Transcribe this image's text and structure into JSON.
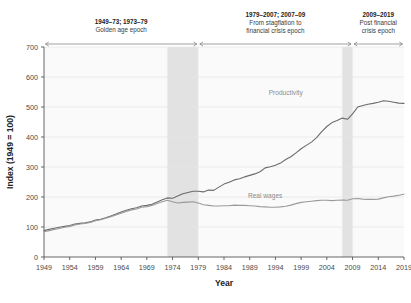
{
  "chart_data": {
    "type": "line",
    "title": "",
    "xlabel": "Year",
    "ylabel": "Index (1949 = 100)",
    "xlim": [
      1949,
      2019
    ],
    "ylim": [
      0,
      700
    ],
    "ytick_step": 100,
    "xtick_step": 5,
    "grid": true,
    "legend_position": "inline-annotations",
    "yticks": [
      "0",
      "100",
      "200",
      "300",
      "400",
      "500",
      "600",
      "700"
    ],
    "xticks": [
      "1949",
      "1954",
      "1959",
      "1964",
      "1969",
      "1974",
      "1979",
      "1984",
      "1989",
      "1994",
      "1999",
      "2004",
      "2009",
      "2014",
      "2019"
    ],
    "series": [
      {
        "name": "Productivity",
        "color": "#6b6b6b",
        "label_x": 1996,
        "label_y": 540,
        "x": [
          1949,
          1950,
          1951,
          1952,
          1953,
          1954,
          1955,
          1956,
          1957,
          1958,
          1959,
          1960,
          1961,
          1962,
          1963,
          1964,
          1965,
          1966,
          1967,
          1968,
          1969,
          1970,
          1971,
          1972,
          1973,
          1974,
          1975,
          1976,
          1977,
          1978,
          1979,
          1980,
          1981,
          1982,
          1983,
          1984,
          1985,
          1986,
          1987,
          1988,
          1989,
          1990,
          1991,
          1992,
          1993,
          1994,
          1995,
          1996,
          1997,
          1998,
          1999,
          2000,
          2001,
          2002,
          2003,
          2004,
          2005,
          2006,
          2007,
          2008,
          2009,
          2010,
          2011,
          2012,
          2013,
          2014,
          2015,
          2016,
          2017,
          2018,
          2019
        ],
        "values": [
          88,
          92,
          96,
          99,
          102,
          105,
          110,
          112,
          114,
          117,
          123,
          126,
          131,
          137,
          143,
          150,
          156,
          161,
          164,
          170,
          172,
          176,
          183,
          191,
          197,
          196,
          203,
          211,
          215,
          219,
          219,
          217,
          223,
          222,
          233,
          243,
          249,
          257,
          261,
          267,
          272,
          277,
          284,
          297,
          301,
          306,
          313,
          325,
          334,
          347,
          361,
          372,
          383,
          398,
          418,
          435,
          448,
          455,
          463,
          459,
          477,
          500,
          505,
          509,
          512,
          516,
          521,
          519,
          516,
          513,
          512
        ]
      },
      {
        "name": "Real wages",
        "color": "#9a9a9a",
        "label_x": 1992,
        "label_y": 198,
        "x": [
          1949,
          1950,
          1951,
          1952,
          1953,
          1954,
          1955,
          1956,
          1957,
          1958,
          1959,
          1960,
          1961,
          1962,
          1963,
          1964,
          1965,
          1966,
          1967,
          1968,
          1969,
          1970,
          1971,
          1972,
          1973,
          1974,
          1975,
          1976,
          1977,
          1978,
          1979,
          1980,
          1981,
          1982,
          1983,
          1984,
          1985,
          1986,
          1987,
          1988,
          1989,
          1990,
          1991,
          1992,
          1993,
          1994,
          1995,
          1996,
          1997,
          1998,
          1999,
          2000,
          2001,
          2002,
          2003,
          2004,
          2005,
          2006,
          2007,
          2008,
          2009,
          2010,
          2011,
          2012,
          2013,
          2014,
          2015,
          2016,
          2017,
          2018,
          2019
        ],
        "values": [
          84,
          88,
          92,
          95,
          99,
          102,
          107,
          110,
          112,
          115,
          121,
          124,
          129,
          134,
          140,
          146,
          152,
          157,
          160,
          166,
          168,
          172,
          178,
          184,
          189,
          184,
          180,
          182,
          183,
          184,
          180,
          174,
          172,
          170,
          170,
          171,
          171,
          173,
          172,
          172,
          171,
          170,
          168,
          167,
          166,
          166,
          167,
          169,
          173,
          178,
          182,
          184,
          186,
          188,
          189,
          189,
          188,
          189,
          190,
          189,
          194,
          195,
          193,
          192,
          192,
          193,
          197,
          201,
          203,
          206,
          209
        ]
      }
    ],
    "shaded_bands": [
      {
        "name": "1973-79 band",
        "start": 1973,
        "end": 1979,
        "color": "#e2e2e2"
      },
      {
        "name": "2007-09 band",
        "start": 2007,
        "end": 2009,
        "color": "#e2e2e2"
      }
    ],
    "epochs": [
      {
        "id": "golden-age",
        "bold": "1949–73; 1973–79",
        "sub_line1": "Golden age epoch",
        "sub_line2": "",
        "start": 1949,
        "end": 1979
      },
      {
        "id": "stagflation",
        "bold": "1979–2007; 2007–09",
        "sub_line1": "From stagflation to",
        "sub_line2": "financial crisis epoch",
        "start": 1979,
        "end": 2009
      },
      {
        "id": "post-crisis",
        "bold": "2009–2019",
        "sub_line1": "Post financial",
        "sub_line2": "crisis epoch",
        "start": 2009,
        "end": 2019
      }
    ],
    "colors": {
      "plot_background": "#fafafa",
      "grid": "#e6e6e6",
      "axis": "#555555",
      "text": "#333333"
    }
  }
}
